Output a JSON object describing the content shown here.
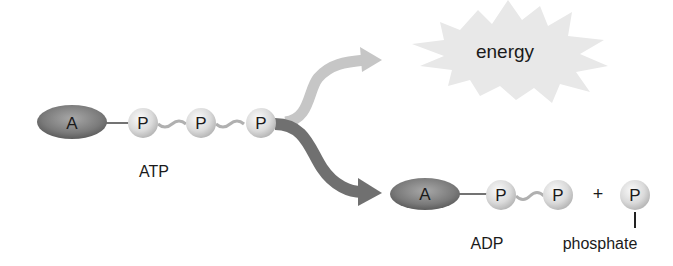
{
  "diagram": {
    "atp": {
      "adenosine_label": "A",
      "phosphate_labels": [
        "P",
        "P",
        "P"
      ],
      "name_label": "ATP"
    },
    "energy": {
      "label": "energy"
    },
    "adp": {
      "adenosine_label": "A",
      "phosphate_labels": [
        "P",
        "P"
      ],
      "name_label": "ADP"
    },
    "plus_sign": "+",
    "free_phosphate": {
      "label": "P",
      "name_label": "phosphate"
    },
    "colors": {
      "adenosine": "#7a7a7a",
      "phosphate": "#dcdcdc",
      "energy_arrow": "#c4c4c4",
      "product_arrow": "#707070",
      "starburst": "#e6e6e6",
      "text": "#1a1a1a"
    }
  }
}
